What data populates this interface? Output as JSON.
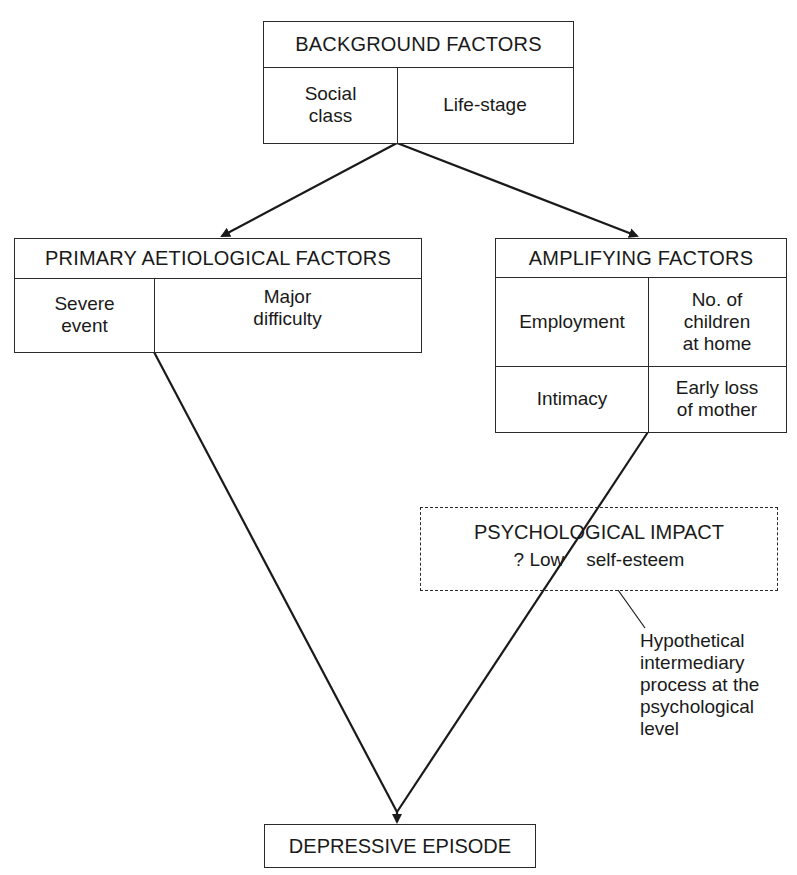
{
  "diagram": {
    "background_factors": {
      "title": "BACKGROUND FACTORS",
      "items": [
        "Social\nclass",
        "Life-stage"
      ]
    },
    "primary_factors": {
      "title": "PRIMARY AETIOLOGICAL FACTORS",
      "items": [
        "Severe\nevent",
        "Major\ndifficulty"
      ]
    },
    "amplifying_factors": {
      "title": "AMPLIFYING FACTORS",
      "items": [
        "Employment",
        "No. of\nchildren\nat home",
        "Intimacy",
        "Early loss\nof mother"
      ]
    },
    "psychological_impact": {
      "title": "PSYCHOLOGICAL IMPACT",
      "subtitle_prefix": "? Low",
      "subtitle_suffix": "self-esteem"
    },
    "annotation": "Hypothetical\nintermediary\nprocess at the\npsychological\nlevel",
    "outcome": "DEPRESSIVE EPISODE",
    "colors": {
      "line": "#2a2a2a",
      "background": "#ffffff"
    }
  }
}
